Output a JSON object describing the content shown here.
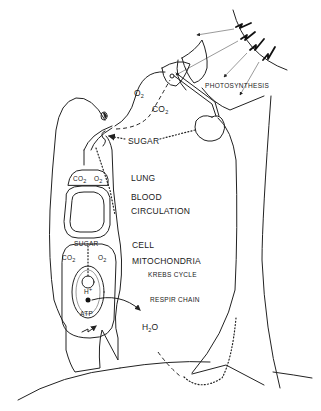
{
  "diagram": {
    "type": "energy-cycle illustration",
    "labels": {
      "o2_air": "O",
      "o2_air_sub": "2",
      "co2_air": "CO",
      "co2_air_sub": "2",
      "sugar_transfer": "SUGAR",
      "photosynthesis": "PHOTOSYNTHESIS",
      "lung": "LUNG",
      "blood": "BLOOD",
      "circulation": "CIRCULATION",
      "cell": "CELL",
      "mitochondria": "MITOCHONDRIA",
      "krebs_cycle": "KREBS CYCLE",
      "respir_chain": "RESPIR CHAIN",
      "h2o": "H",
      "h2o_sub": "2",
      "h2o_tail": "O",
      "lung_co2": "CO",
      "lung_co2_sub": "2",
      "lung_o2": "O",
      "lung_o2_sub": "2",
      "cell_sugar": "SUGAR",
      "cell_co2": "CO",
      "cell_co2_sub": "2",
      "cell_o2": "O",
      "cell_o2_sub": "2",
      "hydrogen_ion": "H",
      "hydrogen_ion_sup": "+",
      "atp": "ATP"
    },
    "elements": {
      "sun": "sun-arc with four lightning-bolt rays",
      "tree": "tree trunk with leaves and an apple",
      "person": "human silhouette with lung, circulation and cell compartments",
      "ground": "curved ground line"
    },
    "colors": {
      "background": "#ffffff",
      "ink": "#1a1a1a"
    }
  }
}
